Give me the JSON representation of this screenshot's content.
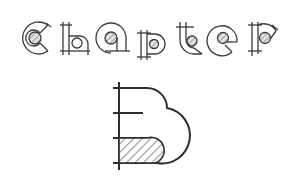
{
  "title": {
    "word": "Chapter",
    "letters": [
      "C",
      "h",
      "a",
      "p",
      "t",
      "e",
      "r"
    ]
  },
  "chapter_letter": "B",
  "colors": {
    "stroke": "#3a3a3a",
    "hatch_fill": "#d9d9d9",
    "background": "#ffffff"
  }
}
